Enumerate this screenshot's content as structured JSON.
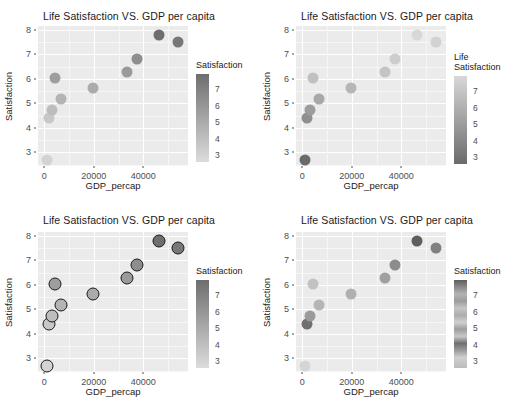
{
  "figure": {
    "layout": "2x2 panel grid of scatter plots",
    "background": "#ffffff",
    "panel_background": "#ebebeb",
    "gridline_color": "#ffffff"
  },
  "chart_data": [
    {
      "type": "scatter",
      "panel": "top-left",
      "title": "Life Satisfaction VS. GDP per capita",
      "xlabel": "GDP_percap",
      "ylabel": "Satisfaction",
      "xlim": [
        -2500,
        58000
      ],
      "ylim": [
        2.45,
        8.15
      ],
      "xticks": [
        0,
        20000,
        40000
      ],
      "xticklabels": [
        "0",
        "20000",
        "40000"
      ],
      "yticks": [
        3,
        4,
        5,
        6,
        7,
        8
      ],
      "yticklabels": [
        "3",
        "4",
        "5",
        "6",
        "7",
        "8"
      ],
      "grid": true,
      "legend": {
        "title": "Satisfaction",
        "title_lines": [
          "Satisfaction"
        ],
        "position": "right",
        "ticks": [
          7,
          6,
          5,
          4,
          3
        ],
        "ticklabels": [
          "7",
          "6",
          "5",
          "4",
          "3"
        ],
        "scale": "continuous-grey",
        "gradient_top": "#6e6e6e",
        "gradient_bottom": "#dcdcdc",
        "direction": "dark-high"
      },
      "x": [
        1300,
        2100,
        3200,
        4300,
        6800,
        19500,
        33500,
        37500,
        46500,
        54000
      ],
      "y": [
        2.7,
        4.4,
        4.75,
        6.02,
        5.18,
        5.63,
        6.28,
        6.8,
        7.8,
        7.48
      ],
      "point_colors": [
        "#d3d3d3",
        "#c8c8c8",
        "#bdbdbd",
        "#9e9e9e",
        "#b4b4b4",
        "#ababab",
        "#9a9a9a",
        "#8e8e8e",
        "#6e6e6e",
        "#777777"
      ],
      "point_stroke": "none",
      "point_size": 11
    },
    {
      "type": "scatter",
      "panel": "top-right",
      "title": "Life Satisfaction VS. GDP per capita",
      "xlabel": "GDP_percap",
      "ylabel": "Satisfaction",
      "xlim": [
        -2500,
        58000
      ],
      "ylim": [
        2.45,
        8.15
      ],
      "xticks": [
        0,
        20000,
        40000
      ],
      "xticklabels": [
        "0",
        "20000",
        "40000"
      ],
      "yticks": [
        3,
        4,
        5,
        6,
        7,
        8
      ],
      "yticklabels": [
        "3",
        "4",
        "5",
        "6",
        "7",
        "8"
      ],
      "grid": true,
      "legend": {
        "title": "Life Satisfaction",
        "title_lines": [
          "Life",
          "Satisfaction"
        ],
        "position": "right",
        "ticks": [
          7,
          6,
          5,
          4,
          3
        ],
        "ticklabels": [
          "7",
          "6",
          "5",
          "4",
          "3"
        ],
        "scale": "continuous-grey-reversed",
        "gradient_top": "#d8d8d8",
        "gradient_bottom": "#6b6b6b",
        "direction": "dark-low"
      },
      "x": [
        1300,
        2100,
        3200,
        4300,
        6800,
        19500,
        33500,
        37500,
        46500,
        54000
      ],
      "y": [
        2.7,
        4.4,
        4.75,
        6.02,
        5.18,
        5.63,
        6.28,
        6.8,
        7.8,
        7.48
      ],
      "point_colors": [
        "#6b6b6b",
        "#8f8f8f",
        "#9c9c9c",
        "#c0c0c0",
        "#a8a8a8",
        "#b6b6b6",
        "#c4c4c4",
        "#cdcdcd",
        "#d8d8d8",
        "#d2d2d2"
      ],
      "point_stroke": "none",
      "point_size": 11
    },
    {
      "type": "scatter",
      "panel": "bottom-left",
      "title": "Life Satisfaction VS. GDP per capita",
      "xlabel": "GDP_percap",
      "ylabel": "Satisfaction",
      "xlim": [
        -2500,
        58000
      ],
      "ylim": [
        2.45,
        8.15
      ],
      "xticks": [
        0,
        20000,
        40000
      ],
      "xticklabels": [
        "0",
        "20000",
        "40000"
      ],
      "yticks": [
        3,
        4,
        5,
        6,
        7,
        8
      ],
      "yticklabels": [
        "3",
        "4",
        "5",
        "6",
        "7",
        "8"
      ],
      "grid": true,
      "legend": {
        "title": "Satisfaction",
        "title_lines": [
          "Satisfaction"
        ],
        "position": "right",
        "ticks": [
          7,
          6,
          5,
          4,
          3
        ],
        "ticklabels": [
          "7",
          "6",
          "5",
          "4",
          "3"
        ],
        "scale": "continuous-grey",
        "gradient_top": "#6e6e6e",
        "gradient_bottom": "#dcdcdc",
        "direction": "dark-high"
      },
      "x": [
        1300,
        2100,
        3200,
        4300,
        6800,
        19500,
        33500,
        37500,
        46500,
        54000
      ],
      "y": [
        2.7,
        4.4,
        4.75,
        6.02,
        5.18,
        5.63,
        6.28,
        6.8,
        7.8,
        7.48
      ],
      "point_colors": [
        "#d3d3d3",
        "#c8c8c8",
        "#bdbdbd",
        "#9e9e9e",
        "#b4b4b4",
        "#ababab",
        "#9a9a9a",
        "#8e8e8e",
        "#6e6e6e",
        "#777777"
      ],
      "point_stroke": "#1a1a1a",
      "point_stroke_width": 1.6,
      "point_size": 13
    },
    {
      "type": "scatter",
      "panel": "bottom-right",
      "title": "Life Satisfaction VS. GDP per capita",
      "xlabel": "GDP_percap",
      "ylabel": "Satisfaction",
      "xlim": [
        -2500,
        58000
      ],
      "ylim": [
        2.45,
        8.15
      ],
      "xticks": [
        0,
        20000,
        40000
      ],
      "xticklabels": [
        "0",
        "20000",
        "40000"
      ],
      "yticks": [
        3,
        4,
        5,
        6,
        7,
        8
      ],
      "yticklabels": [
        "3",
        "4",
        "5",
        "6",
        "7",
        "8"
      ],
      "grid": true,
      "legend": {
        "title": "Satisfaction",
        "title_lines": [
          "Satisfaction"
        ],
        "position": "right",
        "ticks": [
          7,
          6,
          5,
          4,
          3
        ],
        "ticklabels": [
          "7",
          "6",
          "5",
          "4",
          "3"
        ],
        "scale": "banded-grey",
        "banded": true,
        "direction": "non-monotonic"
      },
      "x": [
        1300,
        2100,
        3200,
        4300,
        6800,
        19500,
        33500,
        37500,
        46500,
        54000
      ],
      "y": [
        2.7,
        4.4,
        4.75,
        6.02,
        5.18,
        5.63,
        6.28,
        6.8,
        7.8,
        7.48
      ],
      "point_colors": [
        "#d5d5d5",
        "#707070",
        "#9a9a9a",
        "#c2c2c2",
        "#b5b5b5",
        "#b0b0b0",
        "#a0a0a0",
        "#8c8c8c",
        "#5e5e5e",
        "#808080"
      ],
      "point_stroke": "none",
      "point_size": 11
    }
  ]
}
